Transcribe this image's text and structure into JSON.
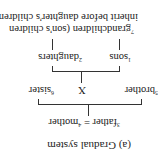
{
  "caption": "(a)  Gradual system",
  "parents": {
    "father": {
      "num": "3",
      "label": "father"
    },
    "equals": "=",
    "mother": {
      "num": "4",
      "label": "mother"
    }
  },
  "siblings": {
    "brother": {
      "num": "5",
      "label": "brother"
    },
    "ego": "X",
    "sister": {
      "num": "6",
      "label": "sister"
    }
  },
  "children": {
    "sons": {
      "num": "1",
      "label": "sons"
    },
    "daughters": {
      "num": "2",
      "label": "daughters"
    }
  },
  "grandchildren": {
    "num": "7",
    "label": "grandchildren (son's children",
    "label2": "inherit before daughter's children)"
  },
  "orientation": "rotated-180"
}
